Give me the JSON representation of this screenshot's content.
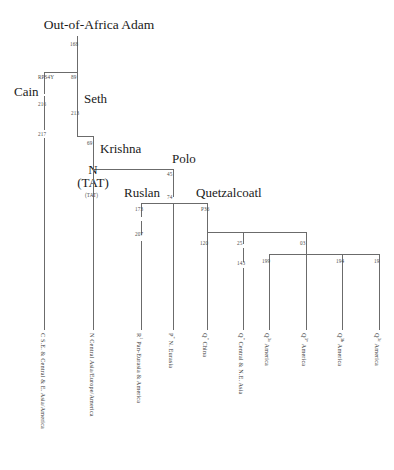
{
  "figure": {
    "type": "phylogenetic-tree",
    "orientation": "top-down"
  },
  "nodes": {
    "root": {
      "label": "Out-of-Africa Adam"
    },
    "cain": {
      "label": "Cain"
    },
    "seth": {
      "label": "Seth"
    },
    "krishna": {
      "label": "Krishna"
    },
    "n_tat_line1": {
      "label": "N"
    },
    "n_tat_line2": {
      "label": "(TAT)"
    },
    "polo": {
      "label": "Polo"
    },
    "ruslan": {
      "label": "Ruslan"
    },
    "quetzalcoatl": {
      "label": "Quetzalcoatl"
    }
  },
  "markers": {
    "root_stem": "168",
    "cain_branch": "RPS4Y",
    "cain_216": "216",
    "cain_217": "217",
    "seth_89": "89",
    "seth_213": "213",
    "krishna_69": "69",
    "n_tat": "(TAT)",
    "polo_45": "45",
    "polo_74": "74",
    "ruslan_173": "173",
    "ruslan_207": "207",
    "quetz_p36": "P36",
    "quetz_120": "120",
    "quetz_25": "25",
    "quetz_143": "143",
    "quetz_03": "03",
    "quetz_199": "199",
    "quetz_194": "194",
    "quetz_19": "19"
  },
  "leaves": [
    {
      "haplogroup": "C",
      "sup": "",
      "region": "S.E. & Central & E. Asia/America"
    },
    {
      "haplogroup": "N",
      "sup": "",
      "region": "Central Asia/Europe/America"
    },
    {
      "haplogroup": "R",
      "sup": "1",
      "region": "Pan-Eurasia & America"
    },
    {
      "haplogroup": "P",
      "sup": "*",
      "region": "N. Eurasia"
    },
    {
      "haplogroup": "Q",
      "sup": "*",
      "region": "China"
    },
    {
      "haplogroup": "Q",
      "sup": "*",
      "region": "Central & N.E. Asia"
    },
    {
      "haplogroup": "Q",
      "sup": "3a",
      "region": "America"
    },
    {
      "haplogroup": "Q",
      "sup": "3*",
      "region": "America"
    },
    {
      "haplogroup": "Q",
      "sup": "3b",
      "region": "America"
    },
    {
      "haplogroup": "Q",
      "sup": "3c",
      "region": "America"
    }
  ],
  "style": {
    "line_color": "#6b6b6b",
    "text_color": "#1a1a1a",
    "marker_color": "#4a4a4a",
    "background": "#ffffff"
  }
}
